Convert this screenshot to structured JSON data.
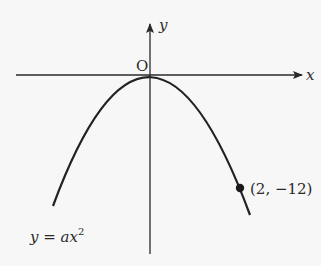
{
  "diagram": {
    "type": "parabola-graph",
    "axes": {
      "x_label": "x",
      "y_label": "y",
      "origin_label": "O"
    },
    "curve": {
      "equation_lhs": "y = ax",
      "equation_exponent": "2",
      "shape": "downward-opening parabola, vertex at origin"
    },
    "point": {
      "label": "(2, −12)",
      "x": 2,
      "y": -12
    },
    "colors": {
      "background": "#f7f7f7",
      "stroke": "#2a2a2a"
    }
  }
}
